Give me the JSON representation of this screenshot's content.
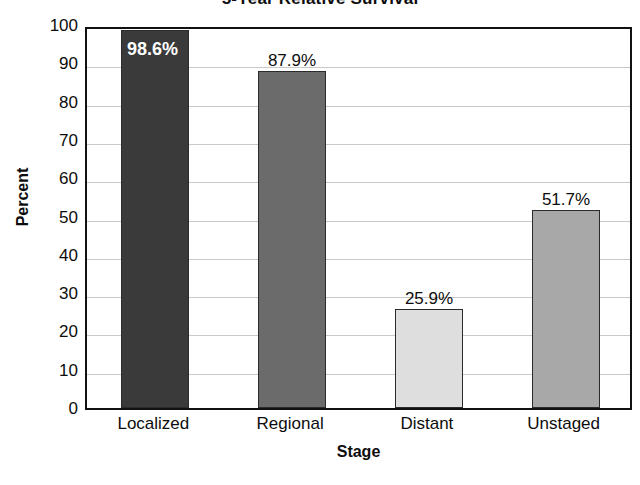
{
  "chart_data": {
    "type": "bar",
    "title": "5-Year Relative Survival",
    "xlabel": "Stage",
    "ylabel": "Percent",
    "categories": [
      "Localized",
      "Regional",
      "Distant",
      "Unstaged"
    ],
    "values": [
      98.6,
      87.9,
      25.9,
      51.7
    ],
    "data_labels": [
      "98.6%",
      "87.9%",
      "25.9%",
      "51.7%"
    ],
    "ylim": [
      0,
      100
    ],
    "ytick_labels": [
      "100",
      "90",
      "80",
      "70",
      "60",
      "50",
      "40",
      "30",
      "20",
      "10",
      "0"
    ],
    "ytick_values": [
      100,
      90,
      80,
      70,
      60,
      50,
      40,
      30,
      20,
      10,
      0
    ],
    "grid": "horizontal",
    "legend": "none",
    "bar_colors": [
      "#3a3a3a",
      "#6b6b6b",
      "#dedede",
      "#a8a8a8"
    ],
    "bar_border_color": "#2b2b2b",
    "label_placement": [
      "inside-top",
      "above",
      "above",
      "above"
    ],
    "label_text_colors": [
      "#ffffff",
      "#0d0d0d",
      "#0d0d0d",
      "#0d0d0d"
    ],
    "gridline_color": "#c9c9c9",
    "axis_color": "#111111",
    "background": "#ffffff"
  }
}
